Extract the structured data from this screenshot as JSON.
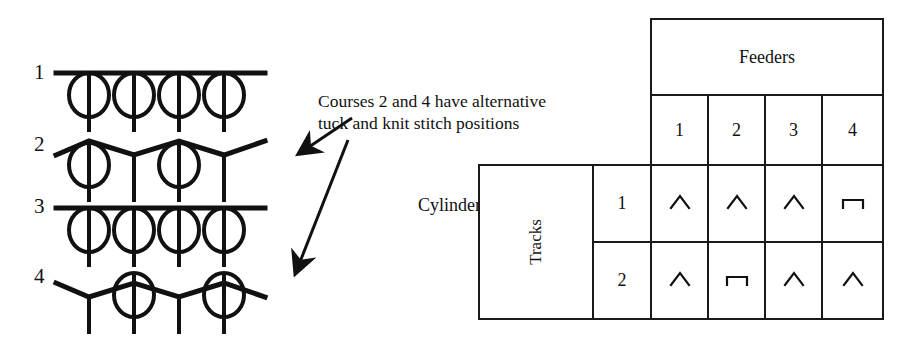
{
  "diagram": {
    "courses": [
      {
        "number": "1",
        "type": "knit-row",
        "loops": [
          1,
          2,
          3,
          4
        ],
        "tucks": []
      },
      {
        "number": "2",
        "type": "tuck-row",
        "loops": [
          1,
          3
        ],
        "tucks": [
          2,
          4
        ]
      },
      {
        "number": "3",
        "type": "knit-row",
        "loops": [
          1,
          2,
          3,
          4
        ],
        "tucks": []
      },
      {
        "number": "4",
        "type": "tuck-row",
        "loops": [
          2,
          4
        ],
        "tucks": [
          1,
          3
        ]
      }
    ],
    "annotation": {
      "line1": "Courses 2 and 4 have alternative",
      "line2": "tuck and knit stitch positions"
    },
    "arrows": [
      {
        "name": "arrow-to-course-2",
        "from_x": 352,
        "from_y": 118,
        "to_x": 296,
        "to_y": 156
      },
      {
        "name": "arrow-to-course-4",
        "from_x": 348,
        "from_y": 138,
        "to_x": 292,
        "to_y": 274
      }
    ]
  },
  "table": {
    "feeders_header": "Feeders",
    "feeder_columns": [
      "1",
      "2",
      "3",
      "4"
    ],
    "tracks_header": "Tracks",
    "cylinder_label": "Cylinder",
    "rows": [
      {
        "track": "1",
        "cells": [
          "knit",
          "knit",
          "knit",
          "tuck"
        ]
      },
      {
        "track": "2",
        "cells": [
          "knit",
          "tuck",
          "knit",
          "knit"
        ]
      }
    ],
    "symbols": {
      "knit": "knit-cam-symbol",
      "tuck": "tuck-cam-symbol"
    }
  },
  "colors": {
    "ink": "#111111",
    "line": "#1a1a1a",
    "background": "#ffffff"
  }
}
